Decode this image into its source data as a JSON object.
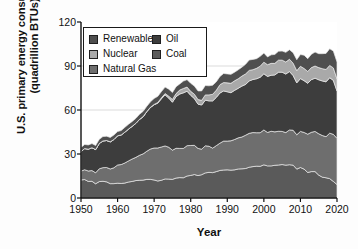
{
  "chart_data": {
    "type": "area",
    "stacked": true,
    "title": "",
    "xlabel": "Year",
    "ylabel": "U.S. primary energy consumption (quadrillion BTUs)",
    "ylabel_line1": "U.S. primary energy consumption",
    "ylabel_line2": "(quadrillion BTUs)",
    "xlim": [
      1950,
      2020
    ],
    "ylim": [
      0,
      120
    ],
    "yticks": [
      0,
      30,
      60,
      90,
      120
    ],
    "xticks": [
      1950,
      1960,
      1970,
      1980,
      1990,
      2000,
      2010,
      2020
    ],
    "grid": "horizontal-light",
    "legend_position": "upper-left-inside",
    "stack_order_bottom_to_top": [
      "Coal",
      "Natural Gas",
      "Oil",
      "Nuclear",
      "Renewables"
    ],
    "x": [
      1950,
      1951,
      1952,
      1953,
      1954,
      1955,
      1956,
      1957,
      1958,
      1959,
      1960,
      1961,
      1962,
      1963,
      1964,
      1965,
      1966,
      1967,
      1968,
      1969,
      1970,
      1971,
      1972,
      1973,
      1974,
      1975,
      1976,
      1977,
      1978,
      1979,
      1980,
      1981,
      1982,
      1983,
      1984,
      1985,
      1986,
      1987,
      1988,
      1989,
      1990,
      1991,
      1992,
      1993,
      1994,
      1995,
      1996,
      1997,
      1998,
      1999,
      2000,
      2001,
      2002,
      2003,
      2004,
      2005,
      2006,
      2007,
      2008,
      2009,
      2010,
      2011,
      2012,
      2013,
      2014,
      2015,
      2016,
      2017,
      2018,
      2019,
      2020
    ],
    "series": [
      {
        "name": "Coal",
        "color": "#5a5a5a",
        "values": [
          12.3,
          12.6,
          11.3,
          11.4,
          9.7,
          11.2,
          11.4,
          11.0,
          9.8,
          9.8,
          10.1,
          9.9,
          10.2,
          10.9,
          11.3,
          11.9,
          12.1,
          12.2,
          12.7,
          12.7,
          12.3,
          11.6,
          12.1,
          13.0,
          12.9,
          12.7,
          13.6,
          13.9,
          13.8,
          15.0,
          15.4,
          16.0,
          15.3,
          15.9,
          17.1,
          17.5,
          17.3,
          18.0,
          18.8,
          19.1,
          19.2,
          19.0,
          19.2,
          19.8,
          19.9,
          20.1,
          21.0,
          21.4,
          21.7,
          21.6,
          22.6,
          21.9,
          21.9,
          22.3,
          22.5,
          22.8,
          22.4,
          22.7,
          22.4,
          19.7,
          20.8,
          19.7,
          17.4,
          18.0,
          18.0,
          15.6,
          14.2,
          13.8,
          13.2,
          11.3,
          9.2
        ]
      },
      {
        "name": "Natural Gas",
        "color": "#6e6e6e",
        "values": [
          6.0,
          6.7,
          7.1,
          7.3,
          7.5,
          8.7,
          9.3,
          9.8,
          10.0,
          10.8,
          12.4,
          12.9,
          13.7,
          14.4,
          15.3,
          15.8,
          17.0,
          17.9,
          19.2,
          20.7,
          21.8,
          22.5,
          22.7,
          22.5,
          21.7,
          19.9,
          20.3,
          19.9,
          20.0,
          20.7,
          20.4,
          19.9,
          18.5,
          17.4,
          18.5,
          17.8,
          16.7,
          17.7,
          18.6,
          19.7,
          19.6,
          20.0,
          20.7,
          21.2,
          21.7,
          22.7,
          23.1,
          23.2,
          22.8,
          22.9,
          23.8,
          22.8,
          23.6,
          22.8,
          23.0,
          22.6,
          22.2,
          23.7,
          23.8,
          23.4,
          24.6,
          25.0,
          26.1,
          26.8,
          27.4,
          28.2,
          28.4,
          28.0,
          31.0,
          32.1,
          31.5
        ]
      },
      {
        "name": "Oil",
        "color": "#3d3d3d",
        "values": [
          13.3,
          14.4,
          14.9,
          15.6,
          15.8,
          17.3,
          18.2,
          18.4,
          18.5,
          19.3,
          19.9,
          20.2,
          21.0,
          21.7,
          22.3,
          23.2,
          24.4,
          25.3,
          27.0,
          28.3,
          29.5,
          30.6,
          32.9,
          34.8,
          33.5,
          32.7,
          35.2,
          37.1,
          37.9,
          37.1,
          34.2,
          31.9,
          30.2,
          30.1,
          31.1,
          30.9,
          32.2,
          32.9,
          34.2,
          34.2,
          33.6,
          32.8,
          33.5,
          33.8,
          34.7,
          34.6,
          35.7,
          36.2,
          36.8,
          37.8,
          38.3,
          38.2,
          38.2,
          38.8,
          40.3,
          40.4,
          39.9,
          39.8,
          37.3,
          35.4,
          36.0,
          35.3,
          34.7,
          35.9,
          36.3,
          36.8,
          37.2,
          37.4,
          37.8,
          36.8,
          32.2
        ]
      },
      {
        "name": "Nuclear",
        "color": "#a9a9a9",
        "values": [
          0.0,
          0.0,
          0.0,
          0.0,
          0.0,
          0.0,
          0.0,
          0.0,
          0.0,
          0.0,
          0.0,
          0.0,
          0.0,
          0.0,
          0.0,
          0.0,
          0.1,
          0.1,
          0.1,
          0.2,
          0.2,
          0.4,
          0.6,
          0.9,
          1.3,
          1.9,
          2.1,
          2.7,
          3.0,
          2.8,
          2.7,
          3.0,
          3.1,
          3.2,
          3.6,
          4.1,
          4.5,
          4.9,
          5.7,
          5.7,
          6.1,
          6.4,
          6.5,
          6.5,
          6.8,
          7.2,
          7.2,
          6.7,
          7.1,
          7.6,
          7.9,
          8.0,
          8.1,
          7.9,
          8.2,
          8.2,
          8.2,
          8.4,
          8.4,
          8.3,
          8.4,
          8.3,
          8.1,
          8.2,
          8.3,
          8.3,
          8.4,
          8.4,
          8.4,
          8.5,
          8.2
        ]
      },
      {
        "name": "Renewables",
        "color": "#4f4f4f",
        "values": [
          2.9,
          2.8,
          2.9,
          2.8,
          2.8,
          2.8,
          3.0,
          2.9,
          3.0,
          3.1,
          2.9,
          3.0,
          3.3,
          3.3,
          3.3,
          3.4,
          3.5,
          3.6,
          3.6,
          3.7,
          4.1,
          4.2,
          4.3,
          4.4,
          4.8,
          4.7,
          4.7,
          4.2,
          5.0,
          5.1,
          5.5,
          5.5,
          5.9,
          6.4,
          6.4,
          6.2,
          6.2,
          5.7,
          5.6,
          6.2,
          6.1,
          6.1,
          5.9,
          6.1,
          6.1,
          6.6,
          7.1,
          7.0,
          6.6,
          6.7,
          6.2,
          5.3,
          5.8,
          6.1,
          6.1,
          6.2,
          6.6,
          6.5,
          7.2,
          7.5,
          8.0,
          9.1,
          8.7,
          9.1,
          9.5,
          9.5,
          10.2,
          11.0,
          11.4,
          11.5,
          11.6
        ]
      }
    ]
  },
  "axes": {
    "ylabel_line1": "U.S. primary energy consumption",
    "ylabel_line2": "(quadrillion BTUs)",
    "xlabel": "Year",
    "ytick_labels": [
      "0",
      "30",
      "60",
      "90",
      "120"
    ],
    "xtick_labels": [
      "1950",
      "1960",
      "1970",
      "1980",
      "1990",
      "2000",
      "2010",
      "2020"
    ]
  },
  "legend": {
    "column_left": [
      {
        "label": "Renewables",
        "color": "#4f4f4f"
      },
      {
        "label": "Nuclear",
        "color": "#a9a9a9"
      },
      {
        "label": "Natural Gas",
        "color": "#6e6e6e"
      }
    ],
    "column_right": [
      {
        "label": "Oil",
        "color": "#3d3d3d"
      },
      {
        "label": "Coal",
        "color": "#5a5a5a"
      }
    ]
  }
}
